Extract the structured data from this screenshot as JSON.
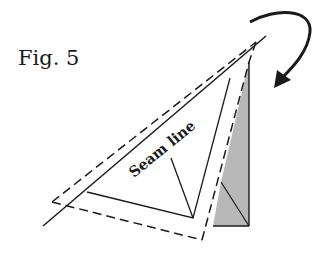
{
  "figure": {
    "title": "Fig. 5",
    "label": "Seam line"
  },
  "colors": {
    "line": "#1a1a1a",
    "shade": "#b8b8b8",
    "background": "#ffffff"
  },
  "elements": {
    "fold_line": "solid diagonal fold edge",
    "seam_triangle": "seam line triangle",
    "seam_allowance": "dashed seam allowance outline",
    "folded_flap": "shaded folded flap",
    "arrow": "curved fold direction arrow"
  }
}
